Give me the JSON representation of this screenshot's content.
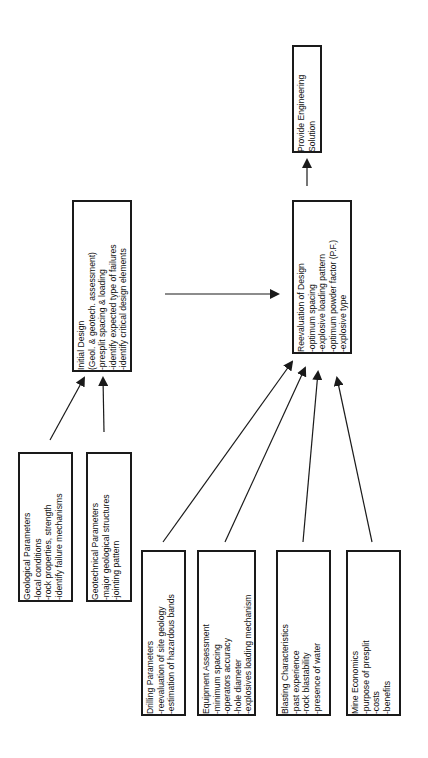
{
  "diagram": {
    "nodes": {
      "solution": {
        "title": "Provide Engineering",
        "lines": [
          "Solution"
        ]
      },
      "initial": {
        "title": "Initial Design",
        "lines": [
          "(Geol. & geotech. assessment)",
          "-presplit spacing & loading",
          "-identify expected type of failures",
          "-identify critical design elements"
        ]
      },
      "reevaluation": {
        "title": "Reevaluation of Design",
        "lines": [
          "-optimum spacing",
          "-explosive loading pattern",
          "-optimum powder factor (P.F.)",
          "-explosive type"
        ]
      },
      "geological": {
        "title": "Geological Parameters",
        "lines": [
          "-local conditions",
          "-rock properties, strength",
          "-identify failure mechanisms"
        ]
      },
      "geotechnical": {
        "title": "Geotechnical Parameters",
        "lines": [
          "-major geological structures",
          "-jointing pattern"
        ]
      },
      "drilling": {
        "title": "Drilling Parameters",
        "lines": [
          "-reevaluation of site geology",
          "-estimation of hazardous bands"
        ]
      },
      "equipment": {
        "title": "Equipment Assessment",
        "lines": [
          "-minimum spacing",
          "-operators accuracy",
          "-hole diameter",
          "-explosives loading mechanism"
        ]
      },
      "blasting": {
        "title": "Blasting Characteristics",
        "lines": [
          "-past experience",
          "-rock blastability",
          "-presence of water"
        ]
      },
      "economics": {
        "title": "Mine Economics",
        "lines": [
          "-purpose of presplit",
          "-costs",
          "-benefits"
        ]
      }
    },
    "edges": [
      {
        "from": "geological",
        "to": "initial"
      },
      {
        "from": "geotechnical",
        "to": "initial"
      },
      {
        "from": "initial",
        "to": "reevaluation"
      },
      {
        "from": "drilling",
        "to": "reevaluation"
      },
      {
        "from": "equipment",
        "to": "reevaluation"
      },
      {
        "from": "blasting",
        "to": "reevaluation"
      },
      {
        "from": "economics",
        "to": "reevaluation"
      },
      {
        "from": "reevaluation",
        "to": "solution"
      }
    ],
    "colors": {
      "stroke": "#1a1a1a",
      "background": "#ffffff"
    }
  }
}
